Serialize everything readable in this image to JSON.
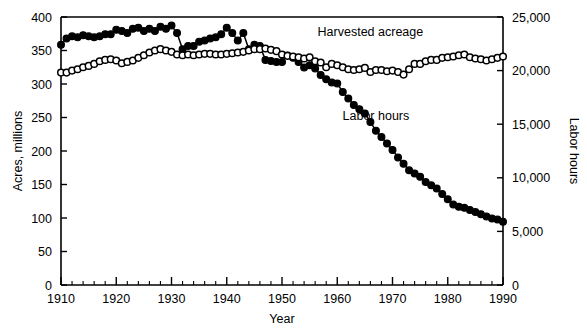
{
  "chart_data": {
    "type": "line",
    "title": "",
    "subtitle": "",
    "xlabel": "Year",
    "ylabel": "Acres, millions",
    "y2label": "Labor hours",
    "xlim": [
      1910,
      1990
    ],
    "ylim": [
      0,
      400
    ],
    "y2lim": [
      0,
      25000
    ],
    "grid": false,
    "legend_position": "inline-annotations",
    "x_ticks": [
      1910,
      1920,
      1930,
      1940,
      1950,
      1960,
      1970,
      1980,
      1990
    ],
    "x_tick_labels": [
      "1910",
      "1920",
      "1930",
      "1940",
      "1950",
      "1960",
      "1970",
      "1980",
      "1990"
    ],
    "x_minor_tick_step": 2,
    "y_ticks": [
      0,
      50,
      100,
      150,
      200,
      250,
      300,
      350,
      400
    ],
    "y_tick_labels": [
      "0",
      "50",
      "100",
      "150",
      "200",
      "250",
      "300",
      "350",
      "400"
    ],
    "y2_ticks": [
      0,
      5000,
      10000,
      15000,
      20000,
      25000
    ],
    "y2_tick_labels": [
      "0",
      "5,000",
      "10,000",
      "15,000",
      "20,000",
      "25,000"
    ],
    "annotations": [
      {
        "text": "Harvested acreage",
        "x": 1966,
        "y": 372
      },
      {
        "text": "Labor hours",
        "x": 1967,
        "y": 247
      }
    ],
    "series": [
      {
        "name": "Harvested acreage",
        "axis": "left",
        "units": "millions of acres",
        "marker": "open-circle",
        "x": [
          1910,
          1911,
          1912,
          1913,
          1914,
          1915,
          1916,
          1917,
          1918,
          1919,
          1920,
          1921,
          1922,
          1923,
          1924,
          1925,
          1926,
          1927,
          1928,
          1929,
          1930,
          1931,
          1932,
          1933,
          1934,
          1935,
          1936,
          1937,
          1938,
          1939,
          1940,
          1941,
          1942,
          1943,
          1944,
          1945,
          1946,
          1947,
          1948,
          1949,
          1950,
          1951,
          1952,
          1953,
          1954,
          1955,
          1956,
          1957,
          1958,
          1959,
          1960,
          1961,
          1962,
          1963,
          1964,
          1965,
          1966,
          1967,
          1968,
          1969,
          1970,
          1971,
          1972,
          1973,
          1974,
          1975,
          1976,
          1977,
          1978,
          1979,
          1980,
          1981,
          1982,
          1983,
          1984,
          1985,
          1986,
          1987,
          1988,
          1989,
          1990
        ],
        "y": [
          317,
          317,
          320,
          322,
          325,
          327,
          330,
          334,
          336,
          337,
          335,
          331,
          333,
          335,
          339,
          343,
          347,
          350,
          352,
          350,
          348,
          344,
          343,
          344,
          343,
          344,
          345,
          345,
          344,
          344,
          345,
          346,
          347,
          348,
          350,
          352,
          352,
          353,
          351,
          349,
          344,
          342,
          341,
          340,
          338,
          340,
          334,
          332,
          325,
          330,
          328,
          325,
          322,
          321,
          322,
          324,
          318,
          321,
          321,
          319,
          320,
          318,
          314,
          322,
          330,
          330,
          334,
          336,
          336,
          339,
          340,
          341,
          343,
          344,
          340,
          338,
          337,
          335,
          337,
          339,
          341
        ],
        "y_right_equivalent": null
      },
      {
        "name": "Labor hours",
        "axis": "right",
        "units": "million labor hours",
        "marker": "filled-circle",
        "x": [
          1910,
          1911,
          1912,
          1913,
          1914,
          1915,
          1916,
          1917,
          1918,
          1919,
          1920,
          1921,
          1922,
          1923,
          1924,
          1925,
          1926,
          1927,
          1928,
          1929,
          1930,
          1931,
          1932,
          1933,
          1934,
          1935,
          1936,
          1937,
          1938,
          1939,
          1940,
          1941,
          1942,
          1943,
          1944,
          1945,
          1946,
          1947,
          1948,
          1949,
          1950,
          1951,
          1952,
          1953,
          1954,
          1955,
          1956,
          1957,
          1958,
          1959,
          1960,
          1961,
          1962,
          1963,
          1964,
          1965,
          1966,
          1967,
          1968,
          1969,
          1970,
          1971,
          1972,
          1973,
          1974,
          1975,
          1976,
          1977,
          1978,
          1979,
          1980,
          1981,
          1982,
          1983,
          1984,
          1985,
          1986,
          1987,
          1988,
          1989,
          1990
        ],
        "y_right": [
          22400,
          23000,
          23200,
          23100,
          23300,
          23200,
          23100,
          23200,
          23400,
          23400,
          23800,
          23700,
          23500,
          23900,
          24000,
          23700,
          23900,
          23700,
          24100,
          23900,
          24200,
          23500,
          22000,
          22300,
          22300,
          22700,
          22800,
          23000,
          23100,
          23400,
          24000,
          23500,
          22800,
          23500,
          22000,
          22400,
          22300,
          21000,
          20900,
          20800,
          20800,
          21400,
          21200,
          20800,
          20300,
          20500,
          20200,
          19600,
          19200,
          18900,
          18800,
          18000,
          17400,
          16800,
          16400,
          16000,
          15200,
          14400,
          13800,
          13200,
          12600,
          11900,
          11300,
          10700,
          10400,
          10100,
          9600,
          9300,
          9000,
          8500,
          8000,
          7500,
          7300,
          7200,
          7000,
          6800,
          6600,
          6400,
          6200,
          6100,
          5900,
          5700,
          5500,
          5400,
          5200,
          5100,
          4900,
          4800,
          4700,
          4600,
          4500
        ],
        "y_right_note": "values are read against the right-hand Labor hours axis (0-25,000)"
      }
    ]
  },
  "figure": {
    "background_color": "#ffffff",
    "ink_color": "#000000"
  }
}
